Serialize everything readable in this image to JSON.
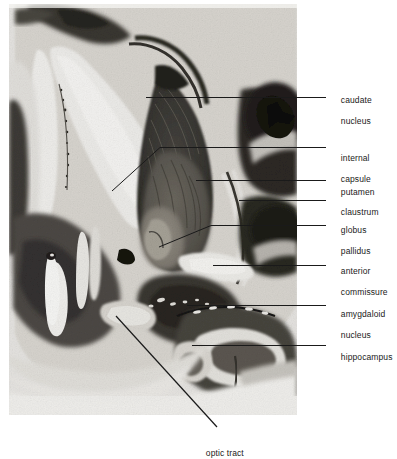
{
  "figure": {
    "kind": "anatomical-photomicrograph",
    "photo": {
      "left": 9,
      "top": 4,
      "width": 288,
      "height": 411,
      "background_color": "#f2f1ee",
      "paper_color": "#ffffff",
      "ink_color": "#1a1a1a"
    },
    "labels": [
      {
        "id": "caudate-nucleus",
        "lines": [
          "caudate",
          "nucleus"
        ],
        "text_x": 331,
        "text_y": 84,
        "leader": "M 145.5,97.5 L 326,97.5",
        "leader_kind": "straight"
      },
      {
        "id": "internal-capsule",
        "lines": [
          "internal",
          "capsule"
        ],
        "text_x": 331,
        "text_y": 142,
        "leader": "M 112,191 L 160,147.5 L 326,147.5",
        "leader_kind": "bent"
      },
      {
        "id": "putamen",
        "lines": [
          "putamen"
        ],
        "text_x": 331,
        "text_y": 176,
        "leader": "M 196,180.5 L 326,180.5",
        "leader_kind": "straight"
      },
      {
        "id": "claustrum",
        "lines": [
          "claustrum"
        ],
        "text_x": 331,
        "text_y": 196,
        "leader": "M 239,200.5 L 326,200.5",
        "leader_kind": "straight"
      },
      {
        "id": "globus-pallidus",
        "lines": [
          "globus",
          "pallidus"
        ],
        "text_x": 331,
        "text_y": 214,
        "leader": "M 159,247 L 211,225.5 L 326,225.5",
        "leader_kind": "bent"
      },
      {
        "id": "anterior-commissure",
        "lines": [
          "anterior",
          "commissure"
        ],
        "text_x": 331,
        "text_y": 255,
        "leader": "M 213,265.5 L 326,265.5",
        "leader_kind": "straight"
      },
      {
        "id": "amygdaloid-nucleus",
        "lines": [
          "amygdaloid",
          "nucleus"
        ],
        "text_x": 331,
        "text_y": 298,
        "leader": "M 187,305.5 L 326,305.5",
        "leader_kind": "straight"
      },
      {
        "id": "hippocampus",
        "lines": [
          "hippocampus"
        ],
        "text_x": 331,
        "text_y": 341,
        "leader": "M 192,345.5 L 326,345.5",
        "leader_kind": "straight"
      },
      {
        "id": "optic-tract",
        "lines": [
          "optic tract"
        ],
        "text_x": 196,
        "text_y": 437,
        "leader": "M 116,316 L 217,427",
        "leader_kind": "diagonal"
      }
    ]
  }
}
